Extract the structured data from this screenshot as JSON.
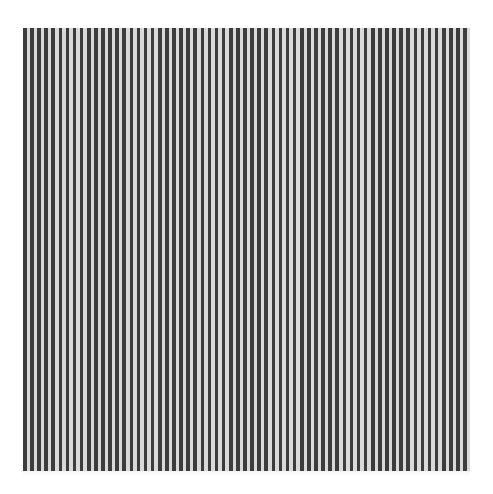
{
  "artwork": {
    "description": "Vertical black and white stripe pattern on white background",
    "colors": {
      "background": "#ffffff",
      "stripe_dark": "#3c3c3c",
      "stripe_light": "#d9d9d9"
    }
  }
}
